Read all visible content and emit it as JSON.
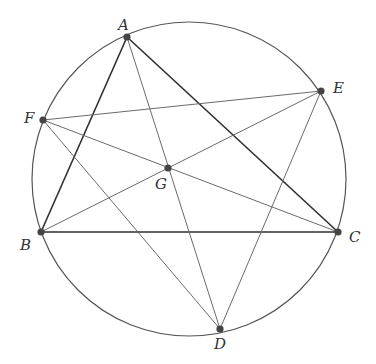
{
  "diagram": {
    "type": "geometry",
    "colors": {
      "background": "#ffffff",
      "circle": "#555555",
      "triangle_edge": "#2f2f2f",
      "auxiliary_edge": "#6a6a6a",
      "point": "#444444",
      "label": "#333333"
    },
    "circle": {
      "cx": 189,
      "cy": 179,
      "r": 157
    },
    "points": [
      {
        "id": "A",
        "label": "A",
        "x": 127,
        "y": 37,
        "lx": 118,
        "ly": 30
      },
      {
        "id": "B",
        "label": "B",
        "x": 41,
        "y": 232,
        "lx": 20,
        "ly": 250
      },
      {
        "id": "C",
        "label": "C",
        "x": 338,
        "y": 232,
        "lx": 349,
        "ly": 242
      },
      {
        "id": "D",
        "label": "D",
        "x": 220,
        "y": 329,
        "lx": 214,
        "ly": 349
      },
      {
        "id": "E",
        "label": "E",
        "x": 321,
        "y": 91,
        "lx": 333,
        "ly": 93
      },
      {
        "id": "F",
        "label": "F",
        "x": 43,
        "y": 120,
        "lx": 24,
        "ly": 123
      },
      {
        "id": "G",
        "label": "G",
        "x": 168,
        "y": 168,
        "lx": 155,
        "ly": 189
      }
    ],
    "segments": [
      {
        "from": "A",
        "to": "B",
        "style": "triangle"
      },
      {
        "from": "B",
        "to": "C",
        "style": "triangle"
      },
      {
        "from": "C",
        "to": "A",
        "style": "triangle"
      },
      {
        "from": "F",
        "to": "E",
        "style": "auxiliary"
      },
      {
        "from": "F",
        "to": "C",
        "style": "auxiliary"
      },
      {
        "from": "F",
        "to": "D",
        "style": "auxiliary"
      },
      {
        "from": "B",
        "to": "E",
        "style": "auxiliary"
      },
      {
        "from": "A",
        "to": "D",
        "style": "auxiliary"
      },
      {
        "from": "E",
        "to": "D",
        "style": "auxiliary"
      }
    ]
  }
}
